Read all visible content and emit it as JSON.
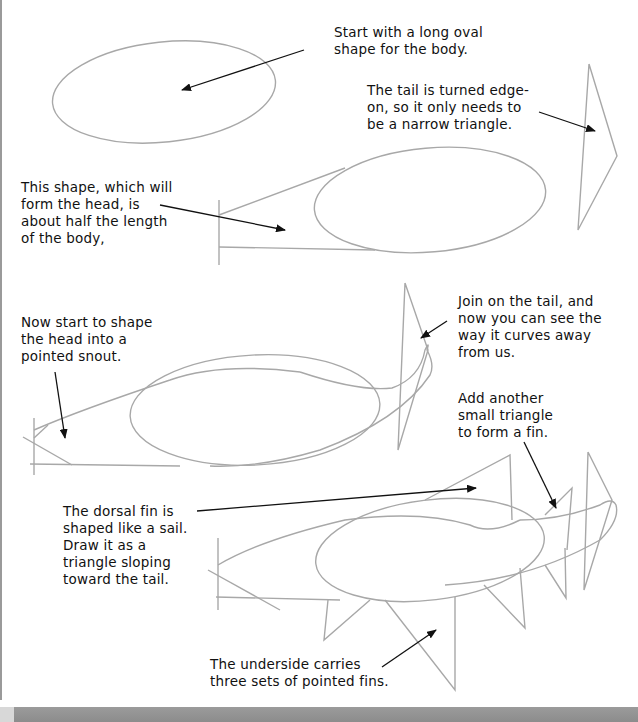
{
  "page": {
    "type": "drawing-tutorial"
  },
  "captions": {
    "body_oval": "Start with a long oval\nshape for the body.",
    "tail_edge_on": "The tail is turned edge-\non, so it only needs to\nbe a narrow triangle.",
    "head_shape": "This shape, which will\nform the head, is\nabout half the length\nof the body,",
    "snout": "Now start to shape\nthe head into a\npointed snout.",
    "join_tail": "Join on the tail, and\nnow you can see the\nway it curves away\nfrom us.",
    "small_fin": "Add another\nsmall triangle\nto form a fin.",
    "dorsal_fin": "The dorsal fin is\nshaped like a sail.\nDraw it as a\ntriangle sloping\ntoward the tail.",
    "underside_fins": "The underside carries\nthree sets of pointed fins."
  },
  "colors": {
    "pencil": "#a8a8a8",
    "ink": "#111111",
    "band": "#939393"
  }
}
